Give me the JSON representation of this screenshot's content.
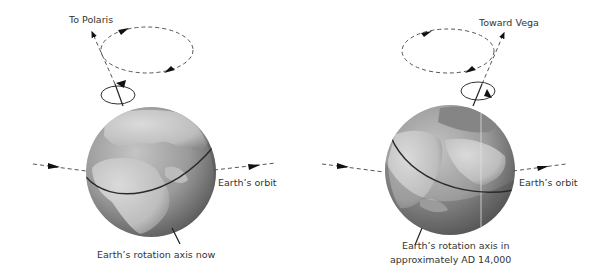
{
  "colors": {
    "background": "#ffffff",
    "line": "#222222",
    "dash": "#555555",
    "ocean_light": "#a8a8a8",
    "ocean_dark": "#5a5a5a",
    "land": "#c9c9c9",
    "text": "#333333"
  },
  "panels": [
    {
      "id": "now",
      "axis_label": "To Polaris",
      "orbit_label": "Earth’s orbit",
      "caption_lines": [
        "Earth’s rotation axis now"
      ]
    },
    {
      "id": "future",
      "axis_label": "Toward Vega",
      "orbit_label": "Earth’s orbit",
      "caption_lines": [
        "Earth’s rotation axis in",
        "approximately AD 14,000"
      ]
    }
  ]
}
